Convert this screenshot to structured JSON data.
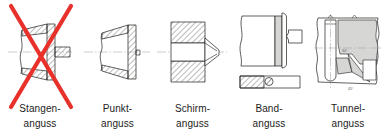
{
  "figure": {
    "background_color": "#ffffff",
    "line_color": "#1d1d1b",
    "hatch_color": "#1d1d1b",
    "fill_gray": "#d6d6d4",
    "centerline_color": "#9a9a98",
    "crossout_color": "#e8312a",
    "text_color": "#1d1d1b"
  },
  "items": [
    {
      "id": "stangenanguss",
      "label_line1": "Stangen-",
      "label_line2": "anguss",
      "crossed_out": true,
      "icon": "sprue-gate-diagram"
    },
    {
      "id": "punktanguss",
      "label_line1": "Punkt-",
      "label_line2": "anguss",
      "crossed_out": false,
      "icon": "pin-point-gate-diagram"
    },
    {
      "id": "schirmanguss",
      "label_line1": "Schirm-",
      "label_line2": "anguss",
      "crossed_out": false,
      "icon": "diaphragm-gate-diagram"
    },
    {
      "id": "bandanguss",
      "label_line1": "Band-",
      "label_line2": "anguss",
      "crossed_out": false,
      "icon": "film-gate-diagram"
    },
    {
      "id": "tunnelanguss",
      "label_line1": "Tunnel-",
      "label_line2": "anguss",
      "crossed_out": false,
      "icon": "tunnel-gate-diagram"
    }
  ]
}
